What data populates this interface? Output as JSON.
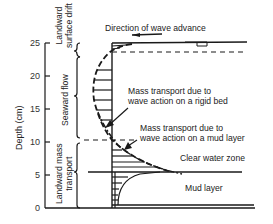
{
  "figure": {
    "y_axis": {
      "label": "Depth (cm)",
      "ticks": [
        "25",
        "20",
        "15",
        "10",
        "5",
        "0"
      ]
    },
    "zone_labels": {
      "landward_surface_drift": [
        "Landward",
        "surface drift"
      ],
      "seaward_flow": "Seaward flow",
      "landward_mass_transport": [
        "Landward mass",
        "transport"
      ]
    },
    "annotations": {
      "direction": "Direction of wave advance",
      "rigid_bed": [
        "Mass transport due to",
        "wave action on a rigid bed"
      ],
      "mud_layer": [
        "Mass transport due to",
        "wave action on a mud layer"
      ],
      "clear_water": "Clear water zone",
      "mud": "Mud layer"
    },
    "colors": {
      "line": "#1a1a1a",
      "background": "#ffffff"
    }
  }
}
